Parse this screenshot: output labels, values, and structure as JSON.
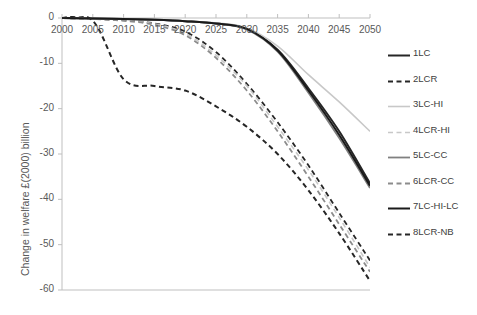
{
  "chart_data": {
    "type": "line",
    "title": "",
    "xlabel": "",
    "ylabel": "Change in welfare £(2000) billion",
    "x": [
      2000,
      2005,
      2010,
      2015,
      2020,
      2025,
      2030,
      2035,
      2040,
      2045,
      2050
    ],
    "xlim": [
      2000,
      2050
    ],
    "ylim": [
      -60,
      0
    ],
    "yticks": [
      0,
      -10,
      -20,
      -30,
      -40,
      -50,
      -60
    ],
    "xticks": [
      2000,
      2005,
      2010,
      2015,
      2020,
      2025,
      2030,
      2035,
      2040,
      2045,
      2050
    ],
    "ytick_labels": [
      "0",
      "-10",
      "-20",
      "-30",
      "-40",
      "-50",
      "-60"
    ],
    "xtick_labels": [
      "2000",
      "2005",
      "2010",
      "2015",
      "2020",
      "2025",
      "2030",
      "2035",
      "2040",
      "2045",
      "2050"
    ],
    "grid": false,
    "legend_position": "right",
    "series": [
      {
        "name": "1LC",
        "style": "solid",
        "color": "#262626",
        "width": 2.0,
        "values": [
          0,
          -0.1,
          -0.2,
          -0.4,
          -0.7,
          -1.2,
          -2.4,
          -7.0,
          -15.5,
          -25.0,
          -36.5
        ]
      },
      {
        "name": "2LCR",
        "style": "dashed",
        "color": "#262626",
        "width": 1.8,
        "values": [
          0,
          -0.2,
          -0.5,
          -1.2,
          -3.0,
          -7.5,
          -14.5,
          -23.0,
          -32.5,
          -43.0,
          -53.5
        ]
      },
      {
        "name": "3LC-HI",
        "style": "solid",
        "color": "#c8c8c8",
        "width": 1.6,
        "values": [
          0,
          -0.1,
          -0.2,
          -0.4,
          -0.7,
          -1.1,
          -2.2,
          -6.2,
          -12.5,
          -18.5,
          -25.0
        ]
      },
      {
        "name": "4LCR-HI",
        "style": "dashed",
        "color": "#c8c8c8",
        "width": 1.6,
        "values": [
          0,
          -0.2,
          -0.5,
          -1.3,
          -3.4,
          -8.2,
          -15.0,
          -24.0,
          -33.5,
          -44.0,
          -55.0
        ]
      },
      {
        "name": "5LC-CC",
        "style": "solid",
        "color": "#808080",
        "width": 1.8,
        "values": [
          0,
          -0.1,
          -0.2,
          -0.4,
          -0.7,
          -1.2,
          -2.5,
          -7.4,
          -16.5,
          -26.5,
          -37.5
        ]
      },
      {
        "name": "6LCR-CC",
        "style": "dashed",
        "color": "#8c8c8c",
        "width": 1.8,
        "values": [
          0,
          -0.2,
          -0.6,
          -1.5,
          -3.8,
          -8.8,
          -16.0,
          -25.0,
          -35.0,
          -45.5,
          -56.0
        ]
      },
      {
        "name": "7LC-HI-LC",
        "style": "solid",
        "color": "#1a1a1a",
        "width": 2.0,
        "values": [
          0,
          -0.1,
          -0.2,
          -0.4,
          -0.7,
          -1.2,
          -2.4,
          -7.2,
          -16.0,
          -25.8,
          -37.0
        ]
      },
      {
        "name": "8LCR-NB",
        "style": "dashed",
        "color": "#262626",
        "width": 2.0,
        "values": [
          0,
          -0.6,
          -13.5,
          -15.0,
          -16.0,
          -19.5,
          -24.0,
          -30.0,
          -38.0,
          -47.5,
          -58.0
        ]
      }
    ]
  },
  "legend": {
    "items": [
      {
        "label": "1LC"
      },
      {
        "label": "2LCR"
      },
      {
        "label": "3LC-HI"
      },
      {
        "label": "4LCR-HI"
      },
      {
        "label": "5LC-CC"
      },
      {
        "label": "6LCR-CC"
      },
      {
        "label": "7LC-HI-LC"
      },
      {
        "label": "8LCR-NB"
      }
    ]
  },
  "colors": {
    "axis": "#bfbfbf",
    "text": "#595959",
    "background": "#ffffff"
  }
}
